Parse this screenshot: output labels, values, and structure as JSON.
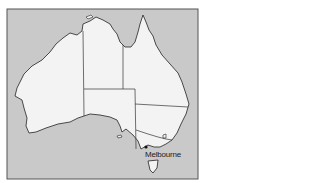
{
  "map": {
    "title": "Map of Australia",
    "colors": {
      "sea": "#c9c9c9",
      "land": "#f3f3f3",
      "border": "#333333",
      "frame": "#555555"
    },
    "cities": [
      {
        "name": "Melbourne",
        "x": 146,
        "y": 147,
        "label_x": 145,
        "label_y": 151
      }
    ]
  }
}
